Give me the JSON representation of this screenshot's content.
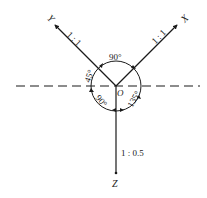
{
  "diagram": {
    "type": "axonometric-axes",
    "origin_label": "O",
    "axes": {
      "x": {
        "label": "X",
        "scale": "1 : 1"
      },
      "y": {
        "label": "Y",
        "scale": "1 : 1"
      },
      "z": {
        "label": "Z",
        "scale": "1 : 0.5"
      }
    },
    "angles": {
      "between_x_y": "90°",
      "y_to_horizontal": "45°",
      "horizontal_to_z": "90°",
      "z_to_x": "135°"
    },
    "colors": {
      "line": "#1a1a1a",
      "background": "#ffffff"
    }
  }
}
